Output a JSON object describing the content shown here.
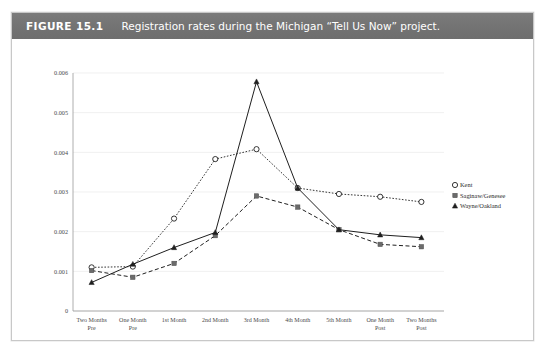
{
  "figure": {
    "label": "FIGURE 15.1",
    "caption": "Registration rates during the Michigan “Tell Us Now” project.",
    "header_bg": "#74 7474",
    "header_color": "#ffffff"
  },
  "chart_data": {
    "type": "line",
    "title": "Registration rates during the Michigan “Tell Us Now” project.",
    "xlabel": "",
    "ylabel": "",
    "categories": [
      "Two Months Pre",
      "One Month Pre",
      "1st Month",
      "2nd Month",
      "3rd Month",
      "4th Month",
      "5th Month",
      "One Month Post",
      "Two Months Post"
    ],
    "yticks": [
      0,
      0.001,
      0.002,
      0.003,
      0.004,
      0.005,
      0.006
    ],
    "ytick_labels": [
      "0",
      "0.001",
      "0.002",
      "0.003",
      "0.004",
      "0.005",
      "0.006"
    ],
    "ylim": [
      0,
      0.006
    ],
    "grid": true,
    "legend_position": "right",
    "series": [
      {
        "name": "Kent",
        "marker": "open-circle",
        "linestyle": "dotted",
        "color": "#1f1f1f",
        "values": [
          0.0011,
          0.00112,
          0.00233,
          0.00383,
          0.00408,
          0.0031,
          0.00295,
          0.00288,
          0.00275
        ]
      },
      {
        "name": "Saginaw/Genesee",
        "marker": "filled-square",
        "linestyle": "dashed",
        "color": "#555555",
        "values": [
          0.00102,
          0.00085,
          0.0012,
          0.0019,
          0.0029,
          0.00262,
          0.00205,
          0.00168,
          0.00162
        ]
      },
      {
        "name": "Wayne/Oakland",
        "marker": "filled-triangle",
        "linestyle": "solid",
        "color": "#1f1f1f",
        "values": [
          0.00072,
          0.00118,
          0.0016,
          0.00198,
          0.00578,
          0.0031,
          0.00205,
          0.00192,
          0.00185
        ]
      }
    ]
  }
}
